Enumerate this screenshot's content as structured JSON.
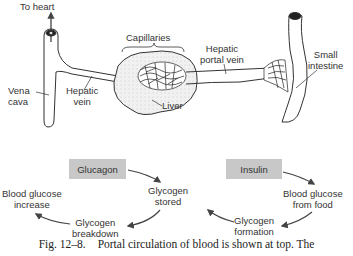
{
  "diagram": {
    "title": "Portal circulation of blood",
    "anatomy_labels": {
      "to_heart": "To heart",
      "vena_cava": [
        "Vena",
        "cava"
      ],
      "hepatic_vein": [
        "Hepatic",
        "vein"
      ],
      "capillaries": "Capillaries",
      "liver": "Liver",
      "hepatic_portal_vein": [
        "Hepatic",
        "portal vein"
      ],
      "small_intestine": [
        "Small",
        "intestine"
      ]
    },
    "glucagon_cycle": {
      "hormone": "Glucagon",
      "nodes": [
        {
          "id": "glycogen_stored",
          "lines": [
            "Glycogen",
            "stored"
          ]
        },
        {
          "id": "glycogen_breakdown",
          "lines": [
            "Glycogen",
            "breakdown"
          ]
        },
        {
          "id": "blood_glucose_increase",
          "lines": [
            "Blood glucose",
            "increase"
          ]
        }
      ]
    },
    "insulin_cycle": {
      "hormone": "Insulin",
      "nodes": [
        {
          "id": "blood_glucose_from_food",
          "lines": [
            "Blood glucose",
            "from food"
          ]
        },
        {
          "id": "glycogen_formation",
          "lines": [
            "Glycogen",
            "formation"
          ]
        },
        {
          "id": "glycogen_stored",
          "lines": [
            "Glycogen",
            "stored"
          ]
        }
      ]
    },
    "colors": {
      "hormone_box": "#c8c8c8",
      "line": "#2a2a2a",
      "liver_fill": "#f1f1f1"
    }
  },
  "caption": {
    "number": "Fig. 12–8.",
    "text": "Portal circulation of blood is shown at top. The"
  }
}
